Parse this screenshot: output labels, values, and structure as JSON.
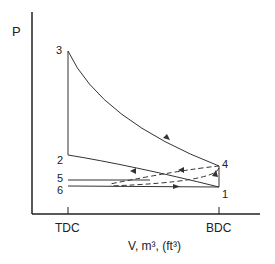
{
  "diagram": {
    "y_axis_label": "P",
    "x_axis_label": "V, m³, (ft³)",
    "x_ticks": [
      {
        "label": "TDC",
        "x": 68
      },
      {
        "label": "BDC",
        "x": 219
      }
    ],
    "points": [
      {
        "id": "1",
        "label": "1",
        "x": 219,
        "y": 187
      },
      {
        "id": "2",
        "label": "2",
        "x": 68,
        "y": 155
      },
      {
        "id": "3",
        "label": "3",
        "x": 68,
        "y": 51
      },
      {
        "id": "4",
        "label": "4",
        "x": 219,
        "y": 166
      },
      {
        "id": "5",
        "label": "5",
        "x": 68,
        "y": 179
      },
      {
        "id": "6",
        "label": "6",
        "x": 68,
        "y": 186
      }
    ],
    "colors": {
      "line": "#333333",
      "background": "#ffffff"
    }
  }
}
